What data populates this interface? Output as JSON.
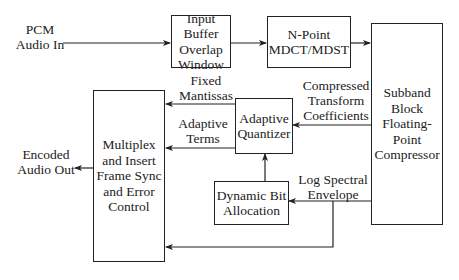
{
  "diagram": {
    "type": "block-diagram",
    "inputs": {
      "pcm_in": "PCM\nAudio In"
    },
    "outputs": {
      "encoded_out": "Encoded\nAudio Out"
    },
    "blocks": {
      "input_buffer": "Input Buffer\nOverlap\nWindow",
      "mdct": "N-Point\nMDCT/MDST",
      "subband": "Subband\nBlock\nFloating-\nPoint\nCompressor",
      "multiplex": "Multiplex\nand Insert\nFrame Sync\nand Error\nControl",
      "quantizer": "Adaptive\nQuantizer",
      "bit_allocation": "Dynamic Bit\nAllocation"
    },
    "edge_labels": {
      "fixed_mantissas": "Fixed\nMantissas",
      "compressed_coeffs": "Compressed\nTransform\nCoefficients",
      "adaptive_terms": "Adaptive\nTerms",
      "log_spectral": "Log Spectral\nEnvelope"
    },
    "colors": {
      "line": "#222222",
      "background": "#ffffff"
    }
  }
}
